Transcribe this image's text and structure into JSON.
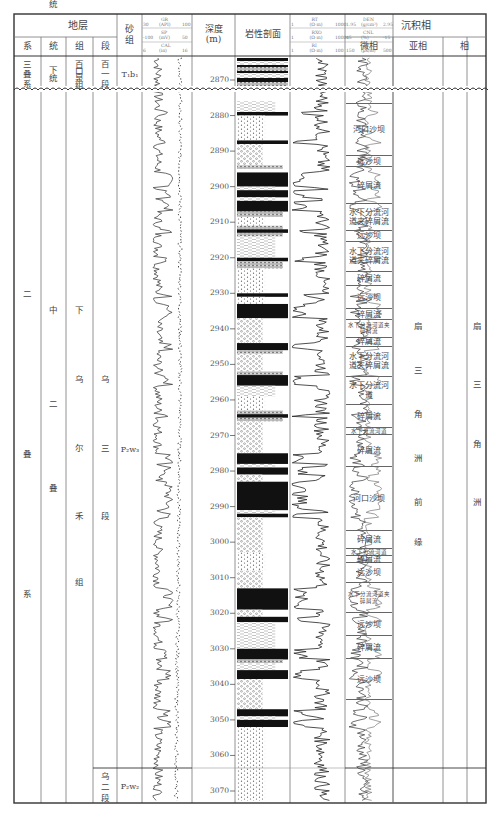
{
  "header": {
    "stratigraphy": "地层",
    "system": "系",
    "series": "统",
    "formation": "组",
    "member": "段",
    "sand_group": "砂组",
    "depth": "深度",
    "depth_unit": "(m)",
    "lithology": "岩性剖面",
    "sedimentary_facies": "沉积相",
    "microfacies": "微相",
    "subfacies": "亚相",
    "facies": "相"
  },
  "log_tracks": {
    "track1": {
      "curves": [
        {
          "name": "GR",
          "unit": "(API)",
          "min": "30",
          "max": "100"
        },
        {
          "name": "SP",
          "unit": "(mV)",
          "min": "-100",
          "max": "50"
        },
        {
          "name": "CAL",
          "unit": "(in)",
          "min": "6",
          "max": "16"
        }
      ]
    },
    "track2": {
      "curves": [
        {
          "name": "RT",
          "unit": "(Ω·m)",
          "min": "1",
          "max": "1000"
        },
        {
          "name": "RXO",
          "unit": "(Ω·m)",
          "min": "1",
          "max": "1000"
        },
        {
          "name": "RI",
          "unit": "(Ω·m)",
          "min": "1",
          "max": "100"
        }
      ]
    },
    "track3": {
      "curves": [
        {
          "name": "DEN",
          "unit": "(g/cm³)",
          "min": "1.95",
          "max": "2.95"
        },
        {
          "name": "CNL",
          "unit": "(%)",
          "min": "45",
          "max": "-15"
        },
        {
          "name": "AC",
          "unit": "(μs/m)",
          "min": "150",
          "max": "500"
        }
      ]
    }
  },
  "upper_unit": {
    "system": "三叠系",
    "series": "下统",
    "formation": "百口泉组",
    "member": "百一段",
    "sand_group": "T₁b₁"
  },
  "main_unit": {
    "system": "二叠系",
    "series": "中二叠统",
    "formation": "下乌尔禾组",
    "member": "乌三段",
    "sand_group": "P₂w₃",
    "subfacies": "扇三角洲前缘",
    "facies": "扇三角洲"
  },
  "lower_unit": {
    "member": "乌二段",
    "sand_group": "P₂w₂"
  },
  "depth_ticks": [
    "2870",
    "2880",
    "2890",
    "2900",
    "2910",
    "2920",
    "2930",
    "2940",
    "2950",
    "2960",
    "2970",
    "2980",
    "2990",
    "3000",
    "3010",
    "3020",
    "3030",
    "3040",
    "3050",
    "3060",
    "3070"
  ],
  "microfacies": [
    {
      "label": "河口沙坝",
      "top": 2876.5,
      "bottom": 2891.5
    },
    {
      "label": "远沙坝",
      "top": 2891.5,
      "bottom": 2894.5
    },
    {
      "label": "碎屑流",
      "top": 2894.5,
      "bottom": 2905
    },
    {
      "label": "水下分流河道夹碎屑流",
      "top": 2905,
      "bottom": 2912.5
    },
    {
      "label": "远沙坝",
      "top": 2912.5,
      "bottom": 2915.5
    },
    {
      "label": "水下分流河道夹碎屑流",
      "top": 2915.5,
      "bottom": 2924
    },
    {
      "label": "碎屑流",
      "top": 2924,
      "bottom": 2928
    },
    {
      "label": "远沙坝",
      "top": 2928,
      "bottom": 2934.5
    },
    {
      "label": "碎屑流",
      "top": 2934.5,
      "bottom": 2937.5
    },
    {
      "label": "水下分流河道夹碎屑流",
      "top": 2937.5,
      "bottom": 2942.5,
      "small": true
    },
    {
      "label": "碎屑流",
      "top": 2942.5,
      "bottom": 2945
    },
    {
      "label": "水下分流河道夹碎屑流",
      "top": 2945,
      "bottom": 2953.5
    },
    {
      "label": "水下分流河道",
      "top": 2953.5,
      "bottom": 2961.5
    },
    {
      "label": "碎屑流",
      "top": 2961.5,
      "bottom": 2968
    },
    {
      "label": "水下分流河道",
      "top": 2968,
      "bottom": 2970,
      "small": true
    },
    {
      "label": "碎屑流",
      "top": 2970,
      "bottom": 2979
    },
    {
      "label": "河口沙坝",
      "top": 2979,
      "bottom": 2997
    },
    {
      "label": "碎屑流",
      "top": 2997,
      "bottom": 3002
    },
    {
      "label": "水下分流河道",
      "top": 3002,
      "bottom": 3004,
      "small": true
    },
    {
      "label": "碎屑流",
      "top": 3004,
      "bottom": 3006
    },
    {
      "label": "远沙坝",
      "top": 3006,
      "bottom": 3011.5
    },
    {
      "label": "水下分流河道夹碎屑流",
      "top": 3011.5,
      "bottom": 3020,
      "small": true
    },
    {
      "label": "远沙坝",
      "top": 3020,
      "bottom": 3026.5
    },
    {
      "label": "碎屑流",
      "top": 3026.5,
      "bottom": 3033
    },
    {
      "label": "远沙坝",
      "top": 3033,
      "bottom": 3044.5
    }
  ],
  "lithology_bands": [
    {
      "top": 2876,
      "bottom": 2879,
      "type": "silt"
    },
    {
      "top": 2879,
      "bottom": 2880,
      "type": "mud"
    },
    {
      "top": 2880,
      "bottom": 2887,
      "type": "sand"
    },
    {
      "top": 2887,
      "bottom": 2888,
      "type": "mud"
    },
    {
      "top": 2888,
      "bottom": 2894,
      "type": "pebbly"
    },
    {
      "top": 2894,
      "bottom": 2895,
      "type": "gravel"
    },
    {
      "top": 2896,
      "bottom": 2900,
      "type": "mud"
    },
    {
      "top": 2900,
      "bottom": 2901,
      "type": "silt"
    },
    {
      "top": 2901,
      "bottom": 2903,
      "type": "mud"
    },
    {
      "top": 2903,
      "bottom": 2904,
      "type": "silt"
    },
    {
      "top": 2904,
      "bottom": 2907,
      "type": "mud"
    },
    {
      "top": 2907,
      "bottom": 2908.5,
      "type": "gravel"
    },
    {
      "top": 2908.5,
      "bottom": 2911,
      "type": "sand"
    },
    {
      "top": 2911,
      "bottom": 2912,
      "type": "gravel"
    },
    {
      "top": 2912,
      "bottom": 2913,
      "type": "mud"
    },
    {
      "top": 2913,
      "bottom": 2914,
      "type": "gravel"
    },
    {
      "top": 2914,
      "bottom": 2920,
      "type": "silt"
    },
    {
      "top": 2920,
      "bottom": 2921,
      "type": "mud"
    },
    {
      "top": 2921,
      "bottom": 2923,
      "type": "gravel"
    },
    {
      "top": 2923,
      "bottom": 2930,
      "type": "sand"
    },
    {
      "top": 2930,
      "bottom": 2931,
      "type": "mud"
    },
    {
      "top": 2931,
      "bottom": 2933,
      "type": "sand"
    },
    {
      "top": 2933,
      "bottom": 2937,
      "type": "mud"
    },
    {
      "top": 2937,
      "bottom": 2944,
      "type": "pebbly"
    },
    {
      "top": 2944,
      "bottom": 2946,
      "type": "mud"
    },
    {
      "top": 2946,
      "bottom": 2947,
      "type": "gravel"
    },
    {
      "top": 2947,
      "bottom": 2952,
      "type": "pebbly"
    },
    {
      "top": 2952,
      "bottom": 2953,
      "type": "gravel"
    },
    {
      "top": 2953,
      "bottom": 2956,
      "type": "mud"
    },
    {
      "top": 2956,
      "bottom": 2959,
      "type": "silt"
    },
    {
      "top": 2959,
      "bottom": 2963,
      "type": "sand"
    },
    {
      "top": 2963,
      "bottom": 2964,
      "type": "gravel"
    },
    {
      "top": 2964,
      "bottom": 2965,
      "type": "mud"
    },
    {
      "top": 2965,
      "bottom": 2966,
      "type": "gravel"
    },
    {
      "top": 2966,
      "bottom": 2975,
      "type": "pebbly"
    },
    {
      "top": 2975,
      "bottom": 2978,
      "type": "mud"
    },
    {
      "top": 2978,
      "bottom": 2979,
      "type": "silt"
    },
    {
      "top": 2979,
      "bottom": 2981,
      "type": "mud"
    },
    {
      "top": 2981,
      "bottom": 2983,
      "type": "pebbly"
    },
    {
      "top": 2983,
      "bottom": 2991,
      "type": "mud"
    },
    {
      "top": 2991,
      "bottom": 2992,
      "type": "silt"
    },
    {
      "top": 2992,
      "bottom": 2993,
      "type": "mud"
    },
    {
      "top": 2993,
      "bottom": 3003,
      "type": "pebbly"
    },
    {
      "top": 3003,
      "bottom": 3008,
      "type": "sand"
    },
    {
      "top": 3008,
      "bottom": 3013,
      "type": "pebbly"
    },
    {
      "top": 3013,
      "bottom": 3019,
      "type": "mud"
    },
    {
      "top": 3019,
      "bottom": 3021,
      "type": "pebbly"
    },
    {
      "top": 3021,
      "bottom": 3022.5,
      "type": "mud"
    },
    {
      "top": 3022.5,
      "bottom": 3030,
      "type": "silt"
    },
    {
      "top": 3030,
      "bottom": 3033,
      "type": "mud"
    },
    {
      "top": 3033,
      "bottom": 3034,
      "type": "gravel"
    },
    {
      "top": 3034,
      "bottom": 3036,
      "type": "silt"
    },
    {
      "top": 3036,
      "bottom": 3038.5,
      "type": "mud"
    },
    {
      "top": 3038.5,
      "bottom": 3047,
      "type": "pebbly"
    },
    {
      "top": 3047,
      "bottom": 3049,
      "type": "mud"
    },
    {
      "top": 3049,
      "bottom": 3050,
      "type": "silt"
    },
    {
      "top": 3050,
      "bottom": 3052,
      "type": "mud"
    },
    {
      "top": 3052,
      "bottom": 3075,
      "type": "sand"
    }
  ],
  "colors": {
    "frame": "#333333",
    "grid": "#777777",
    "text": "#444444",
    "mud": "#111111",
    "curve": "#333333"
  }
}
